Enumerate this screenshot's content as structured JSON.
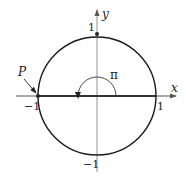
{
  "diagram": {
    "type": "unit-circle",
    "labels": {
      "x_axis": "x",
      "y_axis": "y",
      "x_pos": "1",
      "x_neg": "−1",
      "y_pos": "1",
      "y_neg": "−1",
      "point": "P",
      "angle": "π"
    },
    "point_P": {
      "x": -1,
      "y": 0
    },
    "angle_value": "π",
    "colors": {
      "stroke": "#1a1a1a",
      "axis": "#555555",
      "background": "#ffffff"
    }
  }
}
